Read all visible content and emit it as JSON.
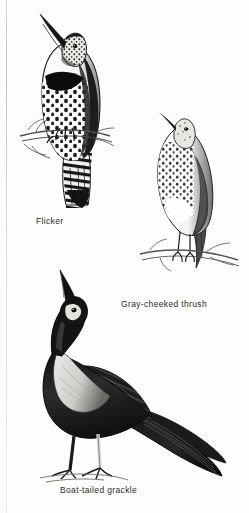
{
  "page": {
    "kind": "field-guide-illustration-plate",
    "background_color": "#fdfdfc",
    "ink_color": "#1a1a1a",
    "caption_color": "#2b2b2b"
  },
  "figures": [
    {
      "id": "flicker",
      "caption": "Flicker",
      "pose": "perched on twig, head raised, bill pointing up-left",
      "markings": "black breast crescent, heavily spotted pale underparts, barred back, long tail"
    },
    {
      "id": "gray-cheeked-thrush",
      "caption": "Gray-cheeked thrush",
      "pose": "perched on branch, head up, body angled right",
      "markings": "streaked and spotted breast, plain pale belly, slender legs"
    },
    {
      "id": "boat-tailed-grackle",
      "caption": "Boat-tailed grackle",
      "pose": "standing on ground, head thrown back with bill pointing skyward",
      "markings": "dark glossy plumage, pale breast panel, very long keeled tail swept to the right"
    }
  ]
}
